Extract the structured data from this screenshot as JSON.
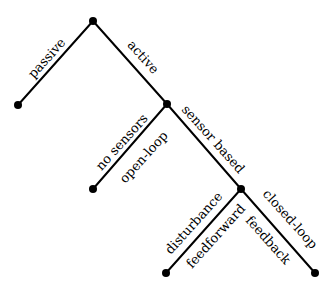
{
  "diagram": {
    "type": "tree",
    "nodes": [
      {
        "id": "root",
        "x": 93,
        "y": 21
      },
      {
        "id": "passive",
        "x": 18,
        "y": 105
      },
      {
        "id": "active",
        "x": 167,
        "y": 104
      },
      {
        "id": "open_loop",
        "x": 93,
        "y": 189
      },
      {
        "id": "sensor_based",
        "x": 241,
        "y": 189
      },
      {
        "id": "feedforward",
        "x": 166,
        "y": 273
      },
      {
        "id": "feedback",
        "x": 315,
        "y": 273
      }
    ],
    "edges": [
      {
        "from": "root",
        "to": "passive",
        "labels": [
          "passive"
        ]
      },
      {
        "from": "root",
        "to": "active",
        "labels": [
          "active"
        ]
      },
      {
        "from": "active",
        "to": "open_loop",
        "labels": [
          "no sensors",
          "open-loop"
        ]
      },
      {
        "from": "active",
        "to": "sensor_based",
        "labels": [
          "sensor based"
        ]
      },
      {
        "from": "sensor_based",
        "to": "feedforward",
        "labels": [
          "disturbance",
          "feedforward"
        ]
      },
      {
        "from": "sensor_based",
        "to": "feedback",
        "labels": [
          "closed-loop",
          "feedback"
        ]
      }
    ]
  },
  "labels": {
    "passive": "passive",
    "active": "active",
    "no_sensors": "no sensors",
    "open_loop": "open-loop",
    "sensor_based": "sensor based",
    "disturbance": "disturbance",
    "feedforward": "feedforward",
    "closed_loop": "closed-loop",
    "feedback": "feedback"
  }
}
